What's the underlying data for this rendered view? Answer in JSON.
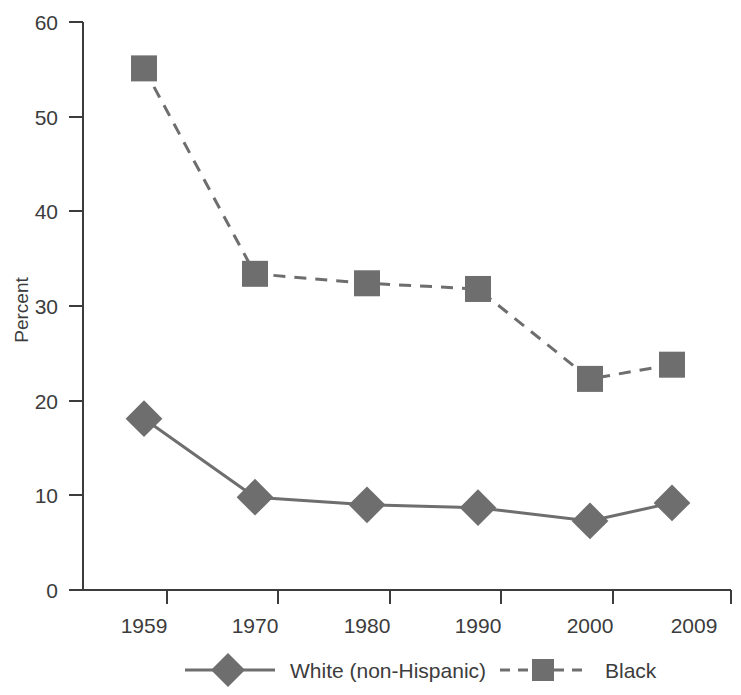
{
  "chart_data": {
    "type": "line",
    "title": "",
    "xlabel": "",
    "ylabel": "Percent",
    "categories": [
      "1959",
      "1970",
      "1980",
      "1990",
      "2000",
      "2009"
    ],
    "x": [
      1959,
      1970,
      1980,
      1990,
      2000,
      2009
    ],
    "ylim": [
      0,
      60
    ],
    "yticks": [
      0,
      10,
      20,
      30,
      40,
      50,
      60
    ],
    "ytick_labels": [
      "0",
      "10",
      "20",
      "30",
      "40",
      "50",
      "60"
    ],
    "grid": false,
    "legend_position": "bottom",
    "series": [
      {
        "name": "White (non-Hispanic)",
        "values": [
          18.1,
          9.8,
          9.0,
          8.7,
          7.3,
          9.2
        ],
        "line_style": "solid",
        "marker": "diamond",
        "color": "#6e6e6e"
      },
      {
        "name": "Black",
        "values": [
          55.1,
          33.4,
          32.4,
          31.8,
          22.3,
          23.8
        ],
        "line_style": "dashed",
        "marker": "square",
        "color": "#6e6e6e"
      }
    ]
  },
  "axes": {
    "y_axis_title": "Percent",
    "y_tick_labels": [
      "60",
      "50",
      "40",
      "30",
      "20",
      "10",
      "0"
    ],
    "x_tick_labels": [
      "1959",
      "1970",
      "1980",
      "1990",
      "2000",
      "2009"
    ]
  },
  "legend": {
    "entries": [
      {
        "label": "White (non-Hispanic)",
        "marker": "diamond-marker",
        "style": "solid"
      },
      {
        "label": "Black",
        "marker": "square-marker",
        "style": "dashed"
      }
    ]
  },
  "colors": {
    "series": "#6e6e6e",
    "axis": "#3c3c3c",
    "text": "#3c3c3c",
    "background": "#ffffff"
  }
}
